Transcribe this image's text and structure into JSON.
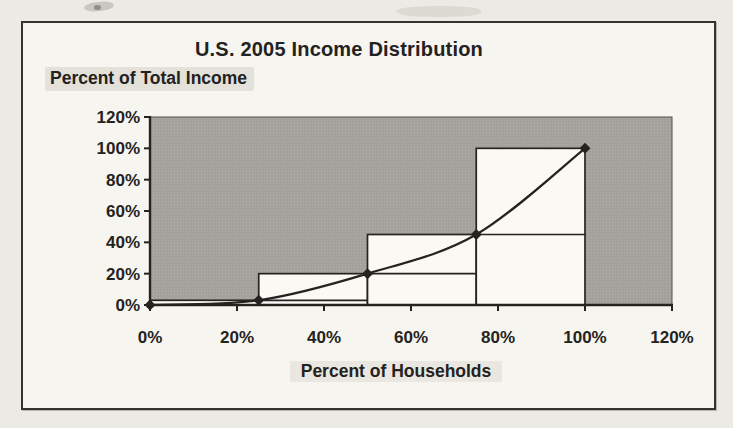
{
  "chart_data": {
    "type": "line",
    "subtype": "lorenz-curve-with-quartile-step-bars",
    "title": "U.S. 2005 Income Distribution",
    "xlabel": "Percent of Households",
    "ylabel": "Percent of Total Income",
    "x": [
      0,
      25,
      50,
      75,
      100
    ],
    "series": [
      {
        "name": "Cumulative percent of total income (smoothed line, diamond markers)",
        "values": [
          0,
          3,
          20,
          45,
          100
        ]
      },
      {
        "name": "Quartile step bars (white columns outlined in black)",
        "segments": [
          {
            "from": 0,
            "to": 25,
            "top": 3
          },
          {
            "from": 25,
            "to": 50,
            "top": 20
          },
          {
            "from": 50,
            "to": 75,
            "top": 45
          },
          {
            "from": 75,
            "to": 100,
            "top": 100
          }
        ]
      }
    ],
    "xlim": [
      0,
      120
    ],
    "ylim": [
      0,
      120
    ],
    "x_ticks": [
      0,
      20,
      40,
      60,
      80,
      100,
      120
    ],
    "y_ticks": [
      0,
      20,
      40,
      60,
      80,
      100,
      120
    ],
    "x_tick_labels": [
      "0%",
      "20%",
      "40%",
      "60%",
      "80%",
      "100%",
      "120%"
    ],
    "y_tick_labels": [
      "0%",
      "20%",
      "40%",
      "60%",
      "80%",
      "100%",
      "120%"
    ],
    "grid": false,
    "legend": false
  },
  "colors": {
    "paper": "#eceae5",
    "chart_bg": "#f7f5f0",
    "plot_bg": "#a2a19c",
    "plot_bg_dot": "#aeada8",
    "plot_border": "#504e49",
    "bar_fill": "#faf9f4",
    "ink": "#242320",
    "frame_border": "#35332f"
  }
}
